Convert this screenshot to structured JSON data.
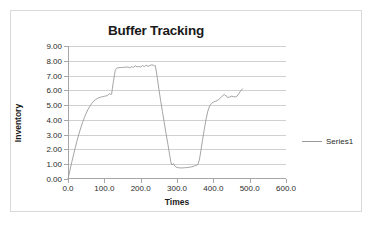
{
  "chart_data": {
    "type": "line",
    "title": "Buffer Tracking",
    "xlabel": "Times",
    "ylabel": "Inventory",
    "xlim": [
      0,
      600
    ],
    "ylim": [
      0,
      9
    ],
    "grid": true,
    "legend_position": "right",
    "xticks": [
      "0.0",
      "100.0",
      "200.0",
      "300.0",
      "400.0",
      "500.0",
      "600.0"
    ],
    "xtick_values": [
      0,
      100,
      200,
      300,
      400,
      500,
      600
    ],
    "yticks": [
      "0.00",
      "1.00",
      "2.00",
      "3.00",
      "4.00",
      "5.00",
      "6.00",
      "7.00",
      "8.00",
      "9.00"
    ],
    "ytick_values": [
      0,
      1,
      2,
      3,
      4,
      5,
      6,
      7,
      8,
      9
    ],
    "series": [
      {
        "name": "Series1",
        "color": "#9a9a9a",
        "x": [
          0,
          5,
          10,
          15,
          20,
          25,
          30,
          35,
          40,
          45,
          50,
          55,
          60,
          65,
          70,
          75,
          80,
          85,
          90,
          95,
          100,
          105,
          110,
          115,
          118,
          120,
          122,
          125,
          128,
          130,
          133,
          136,
          140,
          145,
          150,
          155,
          160,
          165,
          170,
          175,
          180,
          185,
          190,
          195,
          200,
          205,
          210,
          215,
          220,
          225,
          230,
          235,
          238,
          240,
          243,
          246,
          250,
          255,
          260,
          265,
          270,
          275,
          280,
          283,
          286,
          290,
          295,
          300,
          305,
          310,
          315,
          320,
          325,
          330,
          335,
          340,
          345,
          350,
          355,
          358,
          362,
          366,
          370,
          375,
          380,
          385,
          390,
          395,
          400,
          405,
          410,
          415,
          420,
          425,
          430,
          435,
          440,
          445,
          450,
          455,
          460,
          465,
          470,
          475,
          480
        ],
        "y": [
          0.0,
          0.55,
          1.1,
          1.62,
          2.12,
          2.6,
          3.05,
          3.45,
          3.82,
          4.15,
          4.45,
          4.7,
          4.92,
          5.1,
          5.25,
          5.36,
          5.44,
          5.5,
          5.54,
          5.57,
          5.6,
          5.62,
          5.68,
          5.78,
          5.72,
          5.74,
          6.1,
          6.6,
          7.05,
          7.35,
          7.48,
          7.52,
          7.53,
          7.54,
          7.55,
          7.56,
          7.57,
          7.58,
          7.52,
          7.6,
          7.56,
          7.66,
          7.58,
          7.62,
          7.58,
          7.68,
          7.6,
          7.7,
          7.62,
          7.68,
          7.72,
          7.7,
          7.66,
          7.68,
          7.3,
          6.8,
          6.1,
          5.3,
          4.55,
          3.8,
          3.05,
          2.35,
          1.6,
          1.15,
          0.95,
          1.05,
          0.85,
          0.78,
          0.76,
          0.75,
          0.75,
          0.76,
          0.77,
          0.78,
          0.8,
          0.82,
          0.85,
          0.9,
          0.95,
          1.0,
          1.35,
          1.95,
          2.6,
          3.35,
          4.05,
          4.6,
          4.95,
          5.12,
          5.2,
          5.25,
          5.3,
          5.38,
          5.5,
          5.62,
          5.72,
          5.62,
          5.52,
          5.55,
          5.6,
          5.58,
          5.55,
          5.6,
          5.78,
          5.95,
          6.1
        ]
      }
    ]
  },
  "legend": {
    "entries": [
      {
        "label": "Series1"
      }
    ]
  }
}
